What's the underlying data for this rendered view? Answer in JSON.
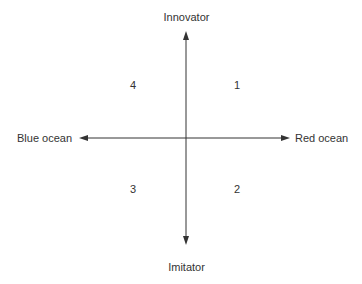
{
  "diagram": {
    "type": "quadrant-matrix",
    "axes": {
      "vertical": {
        "top_label": "Innovator",
        "bottom_label": "Imitator"
      },
      "horizontal": {
        "left_label": "Blue ocean",
        "right_label": "Red ocean"
      }
    },
    "quadrants": {
      "top_right": "1",
      "bottom_right": "2",
      "bottom_left": "3",
      "top_left": "4"
    },
    "colors": {
      "line": "#333333",
      "text": "#333333",
      "background": "#ffffff"
    }
  }
}
